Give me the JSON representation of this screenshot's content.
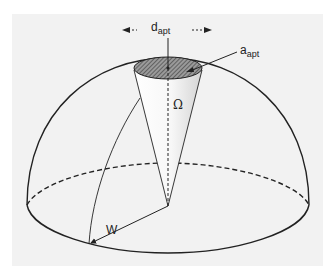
{
  "figure": {
    "type": "hemisphere-aperture-diagram",
    "labels": {
      "diameter": {
        "main": "d",
        "sub": "apt"
      },
      "area": {
        "main": "a",
        "sub": "apt"
      },
      "solid_angle": "Ω",
      "radius": "W"
    },
    "colors": {
      "panel_background": "#f2f2f2",
      "line": "#222222",
      "aperture_fill": "#6a6a6a"
    }
  }
}
